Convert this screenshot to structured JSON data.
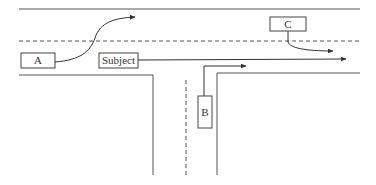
{
  "diagram": {
    "colors": {
      "line": "#555555",
      "box_stroke": "#444444",
      "text": "#333333",
      "background": "#ffffff"
    },
    "vehicles": [
      {
        "id": "A",
        "label": "A"
      },
      {
        "id": "subject",
        "label": "Subject"
      },
      {
        "id": "B",
        "label": "B"
      },
      {
        "id": "C",
        "label": "C"
      }
    ]
  }
}
